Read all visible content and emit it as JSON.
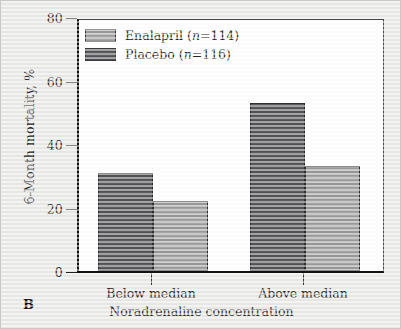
{
  "panel": {
    "label": "B"
  },
  "chart_data": {
    "type": "bar",
    "title": "",
    "subtitle": "",
    "xlabel": "Noradrenaline concentration",
    "ylabel": "6-Month mortality, %",
    "categories": [
      "Below median",
      "Above median"
    ],
    "series": [
      {
        "name": "Enalapril (n=114)",
        "legend_name": "Enalapril",
        "legend_n": "(n=114)",
        "color": "#9e9e9e",
        "values": [
          22,
          33
        ]
      },
      {
        "name": "Placebo (n=116)",
        "legend_name": "Placebo",
        "legend_n": "(n=116)",
        "color": "#56565a",
        "values": [
          31,
          53
        ]
      }
    ],
    "series_draw_order": [
      "Placebo",
      "Enalapril"
    ],
    "ylim": [
      0,
      80
    ],
    "yticks": [
      0,
      20,
      40,
      60,
      80
    ],
    "ytick_labels": [
      "0",
      "20",
      "40",
      "60",
      "80"
    ],
    "xlim_note": "categorical",
    "grid": false,
    "legend_position": "upper left",
    "bar_edge_color": "#2f2f2f",
    "plot_background": "#ffffff",
    "figure_background": "#e9e9e7",
    "axis_color": "#111111"
  }
}
